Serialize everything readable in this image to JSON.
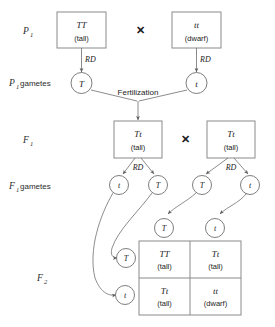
{
  "diagram": {
    "colors": {
      "box_stroke": "#8a8a8a",
      "circle_stroke": "#6f6f6f",
      "connector": "#6f6f6f",
      "text": "#1b1b1b",
      "background": "#ffffff"
    },
    "stage_labels": [
      {
        "name": "p1",
        "base": "P",
        "sub": "1",
        "suffix": ""
      },
      {
        "name": "p1-gametes",
        "base": "P",
        "sub": "1",
        "suffix": "gametes"
      },
      {
        "name": "f1",
        "base": "F",
        "sub": "1",
        "suffix": ""
      },
      {
        "name": "f1-gametes",
        "base": "F",
        "sub": "1",
        "suffix": "gametes"
      },
      {
        "name": "f2",
        "base": "F",
        "sub": "2",
        "suffix": ""
      }
    ],
    "cross_symbol": "✕",
    "rd_label": "RD",
    "fertilization_label": "Fertilization",
    "p1_parents": [
      {
        "genotype": "TT",
        "phenotype": "(tall)"
      },
      {
        "genotype": "tt",
        "phenotype": "(dwarf)"
      }
    ],
    "p1_gametes": [
      {
        "allele": "T"
      },
      {
        "allele": "t"
      }
    ],
    "f1_offspring": [
      {
        "genotype": "Tt",
        "phenotype": "(tall)"
      },
      {
        "genotype": "Tt",
        "phenotype": "(tall)"
      }
    ],
    "f1_gametes": [
      {
        "allele": "t"
      },
      {
        "allele": "T"
      },
      {
        "allele": "T"
      },
      {
        "allele": "t"
      }
    ],
    "punnett": {
      "column_headers": [
        "T",
        "t"
      ],
      "row_headers": [
        "T",
        "t"
      ],
      "cells": [
        [
          {
            "genotype": "TT",
            "phenotype": "(tall)"
          },
          {
            "genotype": "Tt",
            "phenotype": "(tall)"
          }
        ],
        [
          {
            "genotype": "Tt",
            "phenotype": "(tall)"
          },
          {
            "genotype": "tt",
            "phenotype": "(dwarf)"
          }
        ]
      ]
    }
  }
}
